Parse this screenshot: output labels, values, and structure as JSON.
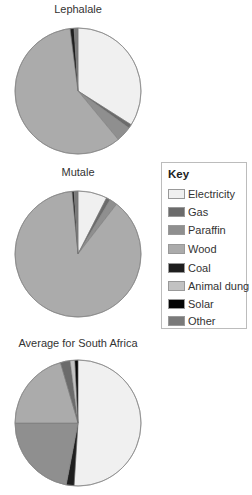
{
  "legend": {
    "title": "Key",
    "items": [
      {
        "label": "Electricity",
        "color": "#f0f0f0"
      },
      {
        "label": "Gas",
        "color": "#6b6b6b"
      },
      {
        "label": "Paraffin",
        "color": "#8f8f8f"
      },
      {
        "label": "Wood",
        "color": "#ababab"
      },
      {
        "label": "Coal",
        "color": "#1e1e1e"
      },
      {
        "label": "Animal dung",
        "color": "#c2c2c2"
      },
      {
        "label": "Solar",
        "color": "#050505"
      },
      {
        "label": "Other",
        "color": "#7a7a7a"
      }
    ]
  },
  "charts": [
    {
      "title": "Lephalale"
    },
    {
      "title": "Mutale"
    },
    {
      "title": "Average for South Africa"
    }
  ],
  "chart_data": [
    {
      "type": "pie",
      "title": "Lephalale",
      "categories": [
        "Electricity",
        "Gas",
        "Paraffin",
        "Wood",
        "Coal",
        "Animal dung",
        "Solar",
        "Other"
      ],
      "values": [
        34,
        1,
        4,
        59,
        1,
        0,
        0,
        1
      ],
      "colors": [
        "#f0f0f0",
        "#6b6b6b",
        "#8f8f8f",
        "#ababab",
        "#1e1e1e",
        "#c2c2c2",
        "#050505",
        "#7a7a7a"
      ],
      "legend_position": "right"
    },
    {
      "type": "pie",
      "title": "Mutale",
      "categories": [
        "Electricity",
        "Gas",
        "Paraffin",
        "Wood",
        "Coal",
        "Animal dung",
        "Solar",
        "Other"
      ],
      "values": [
        7.5,
        1,
        2,
        88,
        0.5,
        0,
        0,
        1
      ],
      "colors": [
        "#f0f0f0",
        "#6b6b6b",
        "#8f8f8f",
        "#ababab",
        "#1e1e1e",
        "#c2c2c2",
        "#050505",
        "#7a7a7a"
      ],
      "legend_position": "right"
    },
    {
      "type": "pie",
      "title": "Average for South Africa",
      "categories": [
        "Electricity",
        "Coal",
        "Paraffin",
        "Wood",
        "Other",
        "Animal dung",
        "Solar"
      ],
      "values": [
        51,
        2,
        22,
        20.5,
        2.5,
        1.2,
        0.8
      ],
      "colors": [
        "#f0f0f0",
        "#1e1e1e",
        "#8f8f8f",
        "#ababab",
        "#6b6b6b",
        "#c2c2c2",
        "#050505"
      ],
      "legend_position": "right"
    }
  ]
}
